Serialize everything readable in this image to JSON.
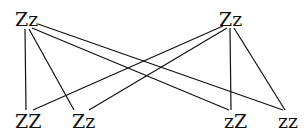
{
  "diagram": {
    "type": "genetic-cross",
    "parents": [
      {
        "id": "p1",
        "label": "Zz",
        "x": 15,
        "y": 10
      },
      {
        "id": "p2",
        "label": "Zz",
        "x": 219,
        "y": 10
      }
    ],
    "offspring": [
      {
        "id": "o1",
        "label": "ZZ",
        "x": 15,
        "y": 112
      },
      {
        "id": "o2",
        "label": "Zz",
        "x": 72,
        "y": 112
      },
      {
        "id": "o3",
        "label": "zZ",
        "x": 224,
        "y": 112
      },
      {
        "id": "o4",
        "label": "zz",
        "x": 278,
        "y": 112
      }
    ],
    "edges": [
      {
        "from": "p1",
        "to": "o1",
        "x1": 25,
        "y1": 29,
        "x2": 26,
        "y2": 110
      },
      {
        "from": "p1",
        "to": "o2",
        "x1": 29,
        "y1": 29,
        "x2": 74,
        "y2": 110
      },
      {
        "from": "p1",
        "to": "o3",
        "x1": 32,
        "y1": 28,
        "x2": 229,
        "y2": 110
      },
      {
        "from": "p1",
        "to": "o4",
        "x1": 38,
        "y1": 24,
        "x2": 283,
        "y2": 110
      },
      {
        "from": "p2",
        "to": "o1",
        "x1": 223,
        "y1": 26,
        "x2": 33,
        "y2": 110
      },
      {
        "from": "p2",
        "to": "o2",
        "x1": 227,
        "y1": 28,
        "x2": 89,
        "y2": 110
      },
      {
        "from": "p2",
        "to": "o3",
        "x1": 230,
        "y1": 28,
        "x2": 231,
        "y2": 110
      },
      {
        "from": "p2",
        "to": "o4",
        "x1": 234,
        "y1": 28,
        "x2": 285,
        "y2": 110
      }
    ]
  }
}
